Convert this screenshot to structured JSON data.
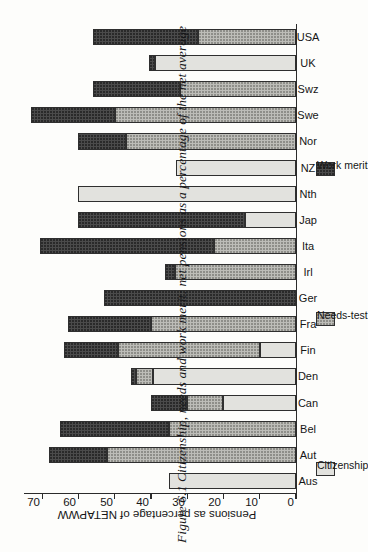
{
  "figure": {
    "number": "Figure 6.1",
    "caption": "Citizenship, needs and work merit: net pensions as a percentage of the net average"
  },
  "chart_data": {
    "type": "bar",
    "subtype": "stacked-horizontal",
    "title": "Citizenship, needs and work merit: net pensions as a percentage of the net average",
    "xlabel": "",
    "ylabel": "Pensions as percentage of NETAPWW",
    "ylim": [
      0,
      75
    ],
    "yticks": [
      0,
      10,
      20,
      30,
      40,
      50,
      60,
      70
    ],
    "grid": false,
    "legend_position": "below-axis",
    "categories": [
      "Aus",
      "Aut",
      "Bel",
      "Can",
      "Den",
      "Fin",
      "Fra",
      "Ger",
      "Irl",
      "Ita",
      "Jap",
      "Nth",
      "NZ",
      "Nor",
      "Swe",
      "Swz",
      "UK",
      "USA"
    ],
    "series": [
      {
        "name": "Citizenship",
        "color": "#e2e2de",
        "values": [
          35,
          0,
          0,
          20,
          39.5,
          10,
          0,
          0,
          0,
          0,
          14,
          60,
          33,
          0,
          0,
          0,
          39,
          0
        ]
      },
      {
        "name": "Needs-test",
        "color": "#bdbdb8",
        "values": [
          0,
          52,
          35,
          10,
          4.5,
          39,
          40,
          0,
          33.5,
          22.5,
          0,
          0,
          0,
          47,
          50,
          32,
          0,
          27
        ]
      },
      {
        "name": "Work merit",
        "color": "#4b4b4b",
        "values": [
          0,
          16,
          30,
          10,
          1.5,
          15,
          23,
          53,
          2.5,
          48,
          46,
          0,
          0,
          13,
          23,
          24,
          1.5,
          29
        ]
      }
    ],
    "totals": [
      35,
      68,
      65,
      40,
      45.5,
      64,
      63,
      53,
      36,
      71,
      60,
      60,
      33,
      60,
      73,
      56,
      40.5,
      56
    ]
  },
  "legend": {
    "items": [
      {
        "label": "Citizenship",
        "color": "#e2e2de"
      },
      {
        "label": "Needs-test",
        "color": "#bdbdb8"
      },
      {
        "label": "Work merit",
        "color": "#4b4b4b"
      }
    ]
  },
  "axis": {
    "value_title": "Pensions as percentage of NETAPWW",
    "tick_labels": [
      "0",
      "10",
      "20",
      "30",
      "40",
      "50",
      "60",
      "70"
    ]
  }
}
